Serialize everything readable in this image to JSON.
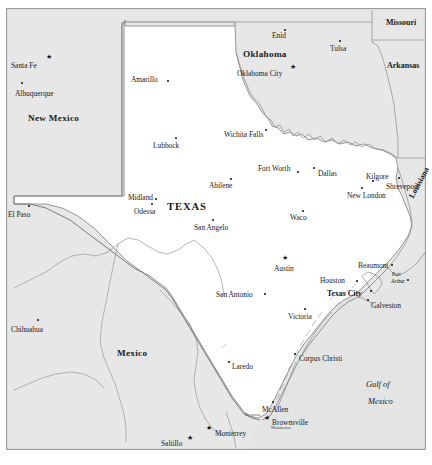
{
  "map": {
    "title": "Texas and surrounding region reference map",
    "colors": {
      "land_outside": "#e7e7e7",
      "land_texas": "#ffffff",
      "water_gulf": "#e4e4e4",
      "border_line": "#8a8a8a",
      "frame": "#9a9a9a",
      "label": "#1a1a1a"
    },
    "frame": {
      "visible": true
    },
    "states": [
      {
        "name": "New Mexico",
        "x": 28,
        "y": 114,
        "class": "state"
      },
      {
        "name": "Oklahoma",
        "x": 243,
        "y": 50,
        "class": "state"
      },
      {
        "name": "Missouri",
        "x": 386,
        "y": 19,
        "class": "state-sm"
      },
      {
        "name": "Arkansas",
        "x": 387,
        "y": 62,
        "class": "state-sm"
      },
      {
        "name": "TEXAS",
        "x": 167,
        "y": 202,
        "class": "state-lg"
      },
      {
        "name": "Mexico",
        "x": 117,
        "y": 349,
        "class": "state"
      },
      {
        "name": "Louisiana",
        "x": 408,
        "y": 196,
        "class": "state-sm",
        "rotate": -62
      }
    ],
    "water_labels": [
      {
        "name": "Gulf of",
        "x": 366,
        "y": 381
      },
      {
        "name": "Mexico",
        "x": 368,
        "y": 398
      }
    ],
    "cities": [
      {
        "name": "Santa Fe",
        "lx": 11,
        "ly": 62,
        "dx": 49,
        "dy": 57,
        "marker": "star"
      },
      {
        "name": "Albuquerque",
        "lx": 15,
        "ly": 90,
        "dx": 21,
        "dy": 82,
        "marker": "dot"
      },
      {
        "name": "Amarillo",
        "lx": 131,
        "ly": 76,
        "dx": 167,
        "dy": 80,
        "marker": "dot"
      },
      {
        "name": "Lubbock",
        "lx": 153,
        "ly": 142,
        "dx": 175,
        "dy": 137,
        "marker": "dot"
      },
      {
        "name": "El Paso",
        "lx": 8,
        "ly": 211,
        "dx": 28,
        "dy": 205,
        "marker": "dot"
      },
      {
        "name": "Midland",
        "lx": 128,
        "ly": 194,
        "dx": 155,
        "dy": 198,
        "marker": "dot"
      },
      {
        "name": "Odessa",
        "lx": 134,
        "ly": 208,
        "dx": 151,
        "dy": 203,
        "marker": "dot"
      },
      {
        "name": "San Angelo",
        "lx": 194,
        "ly": 224,
        "dx": 212,
        "dy": 219,
        "marker": "dot"
      },
      {
        "name": "Abilene",
        "lx": 209,
        "ly": 182,
        "dx": 230,
        "dy": 178,
        "marker": "dot"
      },
      {
        "name": "Wichita Falls",
        "lx": 224,
        "ly": 131,
        "dx": 265,
        "dy": 129,
        "marker": "dot"
      },
      {
        "name": "Enid",
        "lx": 272,
        "ly": 32,
        "dx": 284,
        "dy": 29,
        "marker": "dot"
      },
      {
        "name": "Tulsa",
        "lx": 330,
        "ly": 45,
        "dx": 339,
        "dy": 40,
        "marker": "dot"
      },
      {
        "name": "Oklahoma City",
        "lx": 237,
        "ly": 70,
        "dx": 293,
        "dy": 67,
        "marker": "star"
      },
      {
        "name": "Fort Worth",
        "lx": 258,
        "ly": 165,
        "dx": 297,
        "dy": 171,
        "marker": "dot"
      },
      {
        "name": "Dallas",
        "lx": 318,
        "ly": 170,
        "dx": 313,
        "dy": 167,
        "marker": "dot"
      },
      {
        "name": "Waco",
        "lx": 290,
        "ly": 214,
        "dx": 302,
        "dy": 210,
        "marker": "dot"
      },
      {
        "name": "Kilgore",
        "lx": 366,
        "ly": 173,
        "dx": 372,
        "dy": 180,
        "marker": "dot"
      },
      {
        "name": "Shreveport",
        "lx": 386,
        "ly": 183,
        "dx": 398,
        "dy": 177,
        "marker": "dot"
      },
      {
        "name": "New London",
        "lx": 347,
        "ly": 192,
        "dx": 361,
        "dy": 187,
        "marker": "dot"
      },
      {
        "name": "Austin",
        "lx": 274,
        "ly": 265,
        "dx": 285,
        "dy": 258,
        "marker": "star"
      },
      {
        "name": "San Antonio",
        "lx": 216,
        "ly": 291,
        "dx": 264,
        "dy": 293,
        "marker": "dot"
      },
      {
        "name": "Houston",
        "lx": 320,
        "ly": 277,
        "dx": 356,
        "dy": 280,
        "marker": "dot"
      },
      {
        "name": "Beaumont",
        "lx": 358,
        "ly": 262,
        "dx": 391,
        "dy": 264,
        "marker": "dot"
      },
      {
        "name": "Port",
        "lx": 392,
        "ly": 272,
        "dx": 407,
        "dy": 279,
        "marker": "dot",
        "class": "city-sm"
      },
      {
        "name": "Arthur",
        "lx": 391,
        "ly": 279,
        "class": "city-sm",
        "nomarker": true
      },
      {
        "name": "Texas City",
        "lx": 327,
        "ly": 290,
        "dx": 370,
        "dy": 290,
        "marker": "dot",
        "class": "city-bold"
      },
      {
        "name": "Galveston",
        "lx": 371,
        "ly": 302,
        "dx": 367,
        "dy": 299,
        "marker": "dot"
      },
      {
        "name": "Victoria",
        "lx": 288,
        "ly": 313,
        "dx": 304,
        "dy": 308,
        "marker": "dot"
      },
      {
        "name": "Corpus Christi",
        "lx": 299,
        "ly": 355,
        "dx": 294,
        "dy": 353,
        "marker": "dot"
      },
      {
        "name": "Laredo",
        "lx": 232,
        "ly": 363,
        "dx": 228,
        "dy": 361,
        "marker": "dot"
      },
      {
        "name": "McAllen",
        "lx": 262,
        "ly": 406,
        "dx": 272,
        "dy": 401,
        "marker": "dot"
      },
      {
        "name": "Reynosa",
        "lx": 245,
        "ly": 413,
        "class": "city-xs",
        "nomarker": true
      },
      {
        "name": "Brownsville",
        "lx": 272,
        "ly": 419,
        "dx": 267,
        "dy": 418,
        "marker": "star"
      },
      {
        "name": "Matamoros",
        "lx": 271,
        "ly": 426,
        "class": "city-xs",
        "nomarker": true
      },
      {
        "name": "Monterrey",
        "lx": 215,
        "ly": 430,
        "dx": 209,
        "dy": 428,
        "marker": "star"
      },
      {
        "name": "Saltillo",
        "lx": 161,
        "ly": 440,
        "dx": 190,
        "dy": 438,
        "marker": "star"
      },
      {
        "name": "Chihuahua",
        "lx": 11,
        "ly": 326,
        "dx": 37,
        "dy": 319,
        "marker": "dot"
      }
    ]
  }
}
